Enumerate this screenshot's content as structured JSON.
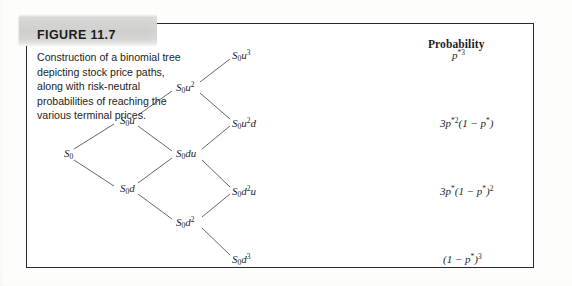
{
  "figure": {
    "label": "FIGURE 11.7",
    "caption": "Construction of a binomial tree depicting stock price paths, along with risk-neutral probabilities of reaching the various terminal prices."
  },
  "diagram": {
    "type": "binomial-tree",
    "steps": 3,
    "probability_header": "Probability",
    "nodes": [
      {
        "id": "n0",
        "label_html": "S<sub>0</sub>",
        "plain": "S0",
        "step": 0,
        "x": 38,
        "y": 131
      },
      {
        "id": "n1u",
        "label_html": "S<sub>0</sub>u",
        "plain": "S0u",
        "step": 1,
        "x": 94,
        "y": 98
      },
      {
        "id": "n1d",
        "label_html": "S<sub>0</sub>d",
        "plain": "S0d",
        "step": 1,
        "x": 94,
        "y": 166
      },
      {
        "id": "n2uu",
        "label_html": "S<sub>0</sub>u<sup>2</sup>",
        "plain": "S0u2",
        "step": 2,
        "x": 150,
        "y": 64
      },
      {
        "id": "n2du",
        "label_html": "S<sub>0</sub>du",
        "plain": "S0du",
        "step": 2,
        "x": 150,
        "y": 131
      },
      {
        "id": "n2dd",
        "label_html": "S<sub>0</sub>d<sup>2</sup>",
        "plain": "S0d2",
        "step": 2,
        "x": 150,
        "y": 199
      },
      {
        "id": "n3a",
        "label_html": "S<sub>0</sub>u<sup>3</sup>",
        "plain": "S0u3",
        "step": 3,
        "x": 206,
        "y": 32
      },
      {
        "id": "n3b",
        "label_html": "S<sub>0</sub>u<sup>2</sup>d",
        "plain": "S0u2d",
        "step": 3,
        "x": 206,
        "y": 100
      },
      {
        "id": "n3c",
        "label_html": "S<sub>0</sub>d<sup>2</sup>u",
        "plain": "S0d2u",
        "step": 3,
        "x": 206,
        "y": 168
      },
      {
        "id": "n3d",
        "label_html": "S<sub>0</sub>d<sup>3</sup>",
        "plain": "S0d3",
        "step": 3,
        "x": 206,
        "y": 236
      }
    ],
    "terminal_probabilities": [
      {
        "node": "n3a",
        "label_html": "p<sup>*3</sup>",
        "plain": "p*3"
      },
      {
        "node": "n3b",
        "label_html": "3p<sup>*2</sup>(1 &minus; p<sup>*</sup>)",
        "plain": "3p*2(1 - p*)"
      },
      {
        "node": "n3c",
        "label_html": "3p<sup>*</sup>(1 &minus; p<sup>*</sup>)<sup>2</sup>",
        "plain": "3p*(1 - p*)^2"
      },
      {
        "node": "n3d",
        "label_html": "(1 &minus; p<sup>*</sup>)<sup>3</sup>",
        "plain": "(1 - p*)^3"
      }
    ]
  },
  "colors": {
    "frame": "#2a2a2a",
    "band": "#cfcfcd",
    "text": "#1f1f1f",
    "page": "#ffffff"
  }
}
